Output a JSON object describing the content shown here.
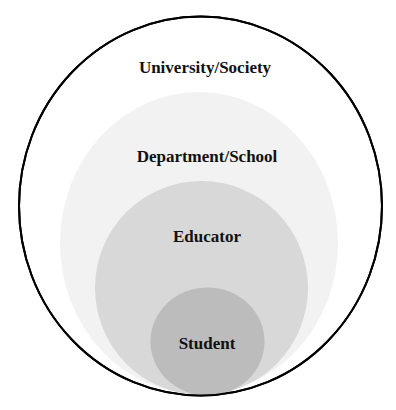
{
  "diagram": {
    "type": "nested-circles",
    "layers": [
      {
        "id": "university",
        "label": "University/Society",
        "fill": "#ffffff",
        "stroke": "#000000"
      },
      {
        "id": "department",
        "label": "Department/School",
        "fill": "#f2f2f2"
      },
      {
        "id": "educator",
        "label": "Educator",
        "fill": "#d8d8d8"
      },
      {
        "id": "student",
        "label": "Student",
        "fill": "#bcbcbc"
      }
    ]
  }
}
